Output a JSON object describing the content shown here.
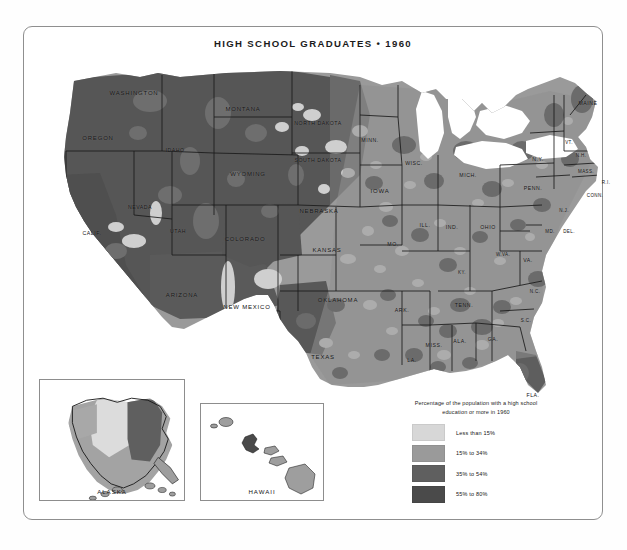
{
  "map": {
    "title": "HIGH SCHOOL GRADUATES • 1960",
    "projection_note": "contiguous united states choropleth"
  },
  "legend": {
    "caption_line_1": "Percentage of the population with a high school",
    "caption_line_2": "education or more in 1960",
    "entries": [
      {
        "label": "Less than 15%",
        "color": "#d7d7d7"
      },
      {
        "label": "15% to 34%",
        "color": "#9a9a9a"
      },
      {
        "label": "35% to 54%",
        "color": "#5f5f5f"
      },
      {
        "label": "55% to 80%",
        "color": "#4a4a4a"
      }
    ]
  },
  "insets": [
    {
      "name": "alaska",
      "label": "ALASKA"
    },
    {
      "name": "hawaii",
      "label": "HAWAII"
    }
  ],
  "states": [
    {
      "abbr": "WASHINGTON",
      "x": 104,
      "y": 38,
      "size": "sz-md"
    },
    {
      "abbr": "OREGON",
      "x": 68,
      "y": 83,
      "size": "sz-md"
    },
    {
      "abbr": "IDAHO",
      "x": 145,
      "y": 95,
      "size": "sz-sm"
    },
    {
      "abbr": "MONTANA",
      "x": 213,
      "y": 54,
      "size": "sz-md"
    },
    {
      "abbr": "WYOMING",
      "x": 218,
      "y": 119,
      "size": "sz-md"
    },
    {
      "abbr": "NEVADA",
      "x": 110,
      "y": 152,
      "size": "sz-sm"
    },
    {
      "abbr": "CALIF.",
      "x": 62,
      "y": 178,
      "size": "sz-sm"
    },
    {
      "abbr": "UTAH",
      "x": 148,
      "y": 176,
      "size": "sz-sm"
    },
    {
      "abbr": "COLORADO",
      "x": 215,
      "y": 184,
      "size": "sz-md"
    },
    {
      "abbr": "ARIZONA",
      "x": 152,
      "y": 240,
      "size": "sz-md"
    },
    {
      "abbr": "NEW MEXICO",
      "x": 217,
      "y": 252,
      "size": "sz-md"
    },
    {
      "abbr": "NORTH DAKOTA",
      "x": 288,
      "y": 68,
      "size": "sz-sm"
    },
    {
      "abbr": "SOUTH DAKOTA",
      "x": 288,
      "y": 105,
      "size": "sz-sm"
    },
    {
      "abbr": "NEBRASKA",
      "x": 289,
      "y": 156,
      "size": "sz-md"
    },
    {
      "abbr": "KANSAS",
      "x": 297,
      "y": 195,
      "size": "sz-md"
    },
    {
      "abbr": "OKLAHOMA",
      "x": 308,
      "y": 245,
      "size": "sz-md"
    },
    {
      "abbr": "TEXAS",
      "x": 293,
      "y": 302,
      "size": "sz-md"
    },
    {
      "abbr": "MINN.",
      "x": 340,
      "y": 85,
      "size": "sz-sm"
    },
    {
      "abbr": "IOWA",
      "x": 350,
      "y": 136,
      "size": "sz-md"
    },
    {
      "abbr": "MO.",
      "x": 363,
      "y": 189,
      "size": "sz-sm"
    },
    {
      "abbr": "ARK.",
      "x": 372,
      "y": 255,
      "size": "sz-sm"
    },
    {
      "abbr": "LA.",
      "x": 382,
      "y": 305,
      "size": "sz-sm"
    },
    {
      "abbr": "WISC.",
      "x": 384,
      "y": 108,
      "size": "sz-sm"
    },
    {
      "abbr": "ILL.",
      "x": 395,
      "y": 170,
      "size": "sz-sm"
    },
    {
      "abbr": "MISS.",
      "x": 404,
      "y": 290,
      "size": "sz-sm"
    },
    {
      "abbr": "IND.",
      "x": 422,
      "y": 172,
      "size": "sz-sm"
    },
    {
      "abbr": "MICH.",
      "x": 438,
      "y": 120,
      "size": "sz-sm"
    },
    {
      "abbr": "KY.",
      "x": 432,
      "y": 217,
      "size": "sz-xs"
    },
    {
      "abbr": "TENN.",
      "x": 434,
      "y": 250,
      "size": "sz-sm"
    },
    {
      "abbr": "ALA.",
      "x": 430,
      "y": 286,
      "size": "sz-sm"
    },
    {
      "abbr": "GA.",
      "x": 463,
      "y": 284,
      "size": "sz-sm"
    },
    {
      "abbr": "FLA.",
      "x": 503,
      "y": 340,
      "size": "sz-sm"
    },
    {
      "abbr": "OHIO",
      "x": 458,
      "y": 172,
      "size": "sz-sm"
    },
    {
      "abbr": "W.VA.",
      "x": 473,
      "y": 199,
      "size": "sz-xs"
    },
    {
      "abbr": "VA.",
      "x": 498,
      "y": 205,
      "size": "sz-sm"
    },
    {
      "abbr": "N.C.",
      "x": 505,
      "y": 236,
      "size": "sz-xs"
    },
    {
      "abbr": "S.C.",
      "x": 496,
      "y": 265,
      "size": "sz-xs"
    },
    {
      "abbr": "PENN.",
      "x": 503,
      "y": 133,
      "size": "sz-sm"
    },
    {
      "abbr": "N.Y.",
      "x": 508,
      "y": 104,
      "size": "sz-sm"
    },
    {
      "abbr": "MAINE",
      "x": 558,
      "y": 48,
      "size": "sz-sm"
    },
    {
      "abbr": "VT.",
      "x": 539,
      "y": 87,
      "size": "sz-xs"
    },
    {
      "abbr": "N.H.",
      "x": 551,
      "y": 100,
      "size": "sz-xs"
    },
    {
      "abbr": "MASS.",
      "x": 556,
      "y": 116,
      "size": "sz-xs"
    },
    {
      "abbr": "R.I.",
      "x": 576,
      "y": 127,
      "size": "sz-xs"
    },
    {
      "abbr": "CONN.",
      "x": 565,
      "y": 140,
      "size": "sz-xs"
    },
    {
      "abbr": "N.J.",
      "x": 534,
      "y": 155,
      "size": "sz-xs"
    },
    {
      "abbr": "MD.",
      "x": 520,
      "y": 176,
      "size": "sz-xs"
    },
    {
      "abbr": "DEL.",
      "x": 539,
      "y": 176,
      "size": "sz-xs"
    }
  ],
  "chart_data": {
    "type": "map",
    "title": "HIGH SCHOOL GRADUATES • 1960",
    "measure": "Percentage of the population with a high school education or more in 1960",
    "scale_type": "choropleth-graduated-gray",
    "classes": [
      {
        "label": "Less than 15%",
        "min": 0,
        "max": 15,
        "color": "#d7d7d7"
      },
      {
        "label": "15% to 34%",
        "min": 15,
        "max": 34,
        "color": "#9a9a9a"
      },
      {
        "label": "35% to 54%",
        "min": 35,
        "max": 54,
        "color": "#5f5f5f"
      },
      {
        "label": "55% to 80%",
        "min": 55,
        "max": 80,
        "color": "#4a4a4a"
      }
    ],
    "regions_shown": [
      "contiguous united states",
      "alaska",
      "hawaii"
    ]
  }
}
